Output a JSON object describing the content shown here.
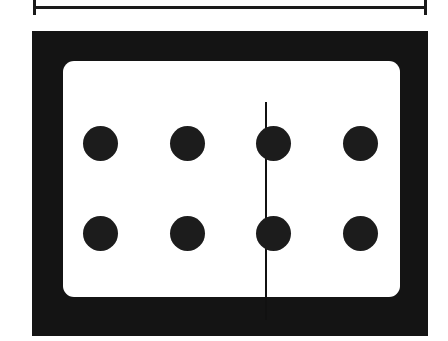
{
  "figure": {
    "kind": "domino-tile-diagram",
    "background_color": "#ffffff",
    "ink_color": "#141414",
    "face_color": "#ffffff"
  },
  "dimension": {
    "label": "",
    "orientation": "horizontal",
    "position": "above-tile",
    "start_x": 33,
    "end_x": 427,
    "span_px": 394,
    "line_y": 7,
    "tick_height": 15,
    "tick_color": "#1a1a1a",
    "line_color": "#1a1a1a"
  },
  "tile": {
    "name": "domino",
    "frame_color": "#141414",
    "face_color": "#ffffff",
    "face_corner_radius": 11,
    "divider_color": "#111111",
    "divider_width": 2,
    "left_half_pip_count": 4,
    "right_half_pip_count": 4,
    "total_pip_count": 8,
    "notation": "4-4",
    "pip_color": "#1c1c1c",
    "pip_diameter": 35,
    "pips": [
      {
        "id": "left-top-outer",
        "half": "left",
        "row": "top",
        "cx": 100,
        "cy": 143
      },
      {
        "id": "left-top-inner",
        "half": "left",
        "row": "top",
        "cx": 187,
        "cy": 143
      },
      {
        "id": "right-top-inner",
        "half": "right",
        "row": "top",
        "cx": 273,
        "cy": 143
      },
      {
        "id": "right-top-outer",
        "half": "right",
        "row": "top",
        "cx": 360,
        "cy": 143
      },
      {
        "id": "left-bot-outer",
        "half": "left",
        "row": "bottom",
        "cx": 100,
        "cy": 233
      },
      {
        "id": "left-bot-inner",
        "half": "left",
        "row": "bottom",
        "cx": 187,
        "cy": 233
      },
      {
        "id": "right-bot-inner",
        "half": "right",
        "row": "bottom",
        "cx": 273,
        "cy": 233
      },
      {
        "id": "right-bot-outer",
        "half": "right",
        "row": "bottom",
        "cx": 360,
        "cy": 233
      }
    ]
  }
}
